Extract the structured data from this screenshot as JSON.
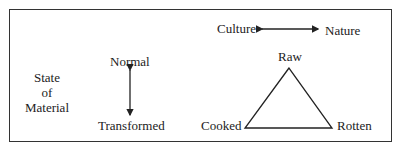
{
  "diagram": {
    "state_label": [
      "State",
      "of",
      "Material"
    ],
    "vertical_axis": {
      "top": "Normal",
      "bottom": "Transformed"
    },
    "horizontal_axis": {
      "left": "Culture",
      "right": "Nature"
    },
    "triangle": {
      "apex": "Raw",
      "left": "Cooked",
      "right": "Rotten"
    }
  }
}
